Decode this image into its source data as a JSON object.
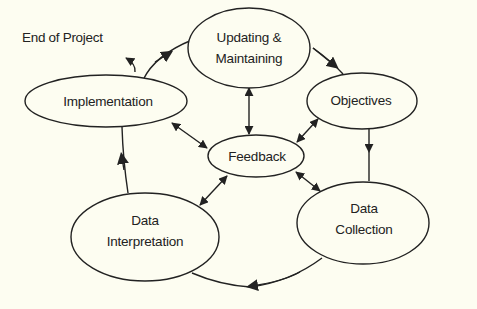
{
  "diagram": {
    "title": "",
    "end_label": "End of Project",
    "nodes": {
      "updating": {
        "line1": "Updating &",
        "line2": "Maintaining"
      },
      "objectives": {
        "line1": "Objectives"
      },
      "implementation": {
        "line1": "Implementation"
      },
      "feedback": {
        "line1": "Feedback"
      },
      "collection": {
        "line1": "Data",
        "line2": "Collection"
      },
      "interpretation": {
        "line1": "Data",
        "line2": "Interpretation"
      }
    },
    "edges": [
      {
        "from": "Updating & Maintaining",
        "to": "Objectives",
        "type": "directed"
      },
      {
        "from": "Objectives",
        "to": "Data Collection",
        "type": "directed"
      },
      {
        "from": "Data Collection",
        "to": "Data Interpretation",
        "type": "directed"
      },
      {
        "from": "Data Interpretation",
        "to": "Implementation",
        "type": "directed"
      },
      {
        "from": "Implementation",
        "to": "Updating & Maintaining",
        "type": "directed"
      },
      {
        "from": "Implementation",
        "to": "End of Project",
        "type": "directed"
      },
      {
        "from": "Feedback",
        "to": "Updating & Maintaining",
        "type": "bidirectional"
      },
      {
        "from": "Feedback",
        "to": "Objectives",
        "type": "bidirectional"
      },
      {
        "from": "Feedback",
        "to": "Implementation",
        "type": "bidirectional"
      },
      {
        "from": "Feedback",
        "to": "Data Collection",
        "type": "bidirectional"
      },
      {
        "from": "Feedback",
        "to": "Data Interpretation",
        "type": "bidirectional"
      }
    ]
  },
  "colors": {
    "background": "#fdfdf1",
    "stroke": "#222222"
  }
}
